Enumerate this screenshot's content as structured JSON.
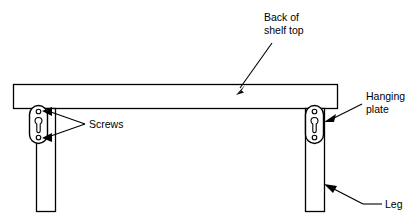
{
  "diagram": {
    "background_color": "#ffffff",
    "line_color": "#000000",
    "labels": {
      "back_of_shelf_top_line1": "Back of",
      "back_of_shelf_top_line2": "shelf top",
      "hanging_plate_line1": "Hanging",
      "hanging_plate_line2": "plate",
      "screws": "Screws",
      "leg": "Leg"
    },
    "parts": [
      {
        "name": "shelf-top",
        "label": "Back of shelf top"
      },
      {
        "name": "hanging-plate-left",
        "label": "Hanging plate"
      },
      {
        "name": "hanging-plate-right",
        "label": "Hanging plate"
      },
      {
        "name": "leg-left",
        "label": "Leg"
      },
      {
        "name": "leg-right",
        "label": "Leg"
      },
      {
        "name": "screws",
        "label": "Screws"
      }
    ]
  }
}
